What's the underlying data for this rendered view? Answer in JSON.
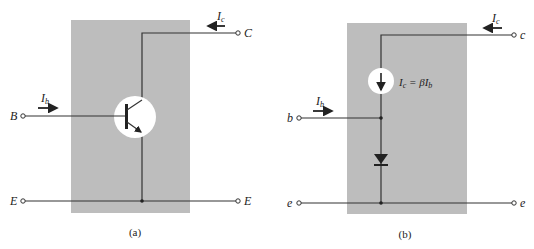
{
  "figure": {
    "colors": {
      "background": "#ffffff",
      "box_fill": "#bdbdbd",
      "wire": "#333333",
      "symbol_fill": "#ffffff"
    },
    "panel_a": {
      "caption": "(a)",
      "terminals": {
        "base": "B",
        "collector": "C",
        "emitter_left": "E",
        "emitter_right": "E"
      },
      "currents": {
        "base": "I",
        "base_sub": "b",
        "collector": "I",
        "collector_sub": "c"
      },
      "component": "npn-transistor"
    },
    "panel_b": {
      "caption": "(b)",
      "terminals": {
        "base": "b",
        "collector": "c",
        "emitter_left": "e",
        "emitter_right": "e"
      },
      "currents": {
        "base": "I",
        "base_sub": "b",
        "collector": "I",
        "collector_sub": "c"
      },
      "source_label": {
        "lhs": "I",
        "lhs_sub": "c",
        "eq": " = βI",
        "rhs_sub": "b"
      },
      "components": [
        "dependent-current-source",
        "diode"
      ]
    }
  }
}
